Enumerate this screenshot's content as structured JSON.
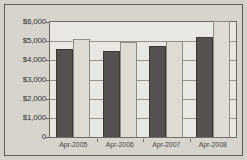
{
  "chart_data": {
    "type": "bar",
    "title": "",
    "xlabel": "",
    "ylabel": "",
    "ylim": [
      0,
      6000
    ],
    "grid": true,
    "legend": "none",
    "categories": [
      "Apr-2005",
      "Apr-2006",
      "Apr-2007",
      "Apr-2008"
    ],
    "ytick_labels": [
      "$6,000",
      "$5,000",
      "$4,000",
      "$3,000",
      "$2,000",
      "$1,000",
      "0"
    ],
    "ytick_values": [
      6000,
      5000,
      4000,
      3000,
      2000,
      1000,
      0
    ],
    "series": [
      {
        "name": "dark-series",
        "color": "#55514f",
        "values": [
          4600,
          4480,
          4760,
          5200
        ]
      },
      {
        "name": "light-series",
        "color": "#dedbd5",
        "values": [
          5100,
          4950,
          5030,
          6050
        ]
      }
    ]
  },
  "colors": {
    "page_background": "#d4d1cb",
    "plot_background": "#e9e7e2",
    "frame": "#5d5a55",
    "axis": "#6f6c67",
    "gridline": "#96938d",
    "text": "#35322e",
    "series_dark": "#55514f",
    "series_light": "#dedbd5"
  }
}
